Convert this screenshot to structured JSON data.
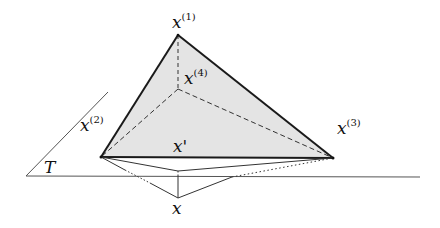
{
  "diagram": {
    "type": "geometric-construction",
    "colors": {
      "line": "#1a1a1a",
      "thin_line": "#333333",
      "face_fill": "#e4e4e4",
      "plane_line": "#555555",
      "background": "#ffffff"
    },
    "points": {
      "x1": {
        "label": "x",
        "superscript": "(1)",
        "x": 178,
        "y": 35
      },
      "x4": {
        "label": "x",
        "superscript": "(4)",
        "x": 178,
        "y": 89
      },
      "x2": {
        "label": "x",
        "superscript": "(2)",
        "x": 101,
        "y": 157
      },
      "x3": {
        "label": "x",
        "superscript": "(3)",
        "x": 333,
        "y": 158
      },
      "xprime": {
        "label": "x'",
        "x": 178,
        "y": 171
      },
      "x": {
        "label": "x",
        "x": 178,
        "y": 198
      }
    },
    "plane": {
      "label": "T"
    }
  }
}
